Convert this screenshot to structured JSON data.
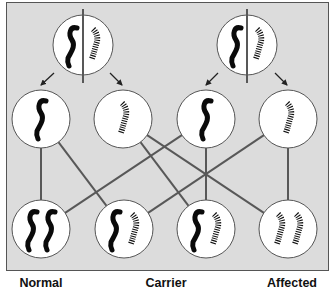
{
  "colors": {
    "panel_background": "#dcdcdc",
    "panel_border": "#555555",
    "circle_fill": "#ffffff",
    "circle_stroke": "#555555",
    "line": "#585858",
    "normal_chromosome": "#0a0a0a",
    "mutant_chromosome": "#111111"
  },
  "parents": [
    {
      "id": "parent-1",
      "cx": 83,
      "cy": 45,
      "r": 30,
      "genotype": "carrier",
      "alleles": [
        "normal",
        "mutant"
      ]
    },
    {
      "id": "parent-2",
      "cx": 247,
      "cy": 45,
      "r": 30,
      "genotype": "carrier",
      "alleles": [
        "normal",
        "mutant"
      ]
    }
  ],
  "gametes": [
    {
      "id": "gamete-1",
      "cx": 41,
      "cy": 119,
      "r": 29,
      "allele": "normal",
      "from": "parent-1"
    },
    {
      "id": "gamete-2",
      "cx": 123,
      "cy": 119,
      "r": 29,
      "allele": "mutant",
      "from": "parent-1"
    },
    {
      "id": "gamete-3",
      "cx": 206,
      "cy": 119,
      "r": 29,
      "allele": "normal",
      "from": "parent-2"
    },
    {
      "id": "gamete-4",
      "cx": 288,
      "cy": 119,
      "r": 29,
      "allele": "mutant",
      "from": "parent-2"
    }
  ],
  "offspring": [
    {
      "id": "offspring-1",
      "cx": 41,
      "cy": 229,
      "r": 29,
      "alleles": [
        "normal",
        "normal"
      ],
      "genotype": "normal"
    },
    {
      "id": "offspring-2",
      "cx": 124,
      "cy": 229,
      "r": 29,
      "alleles": [
        "normal",
        "mutant"
      ],
      "genotype": "carrier"
    },
    {
      "id": "offspring-3",
      "cx": 206,
      "cy": 229,
      "r": 29,
      "alleles": [
        "normal",
        "mutant"
      ],
      "genotype": "carrier"
    },
    {
      "id": "offspring-4",
      "cx": 288,
      "cy": 229,
      "r": 29,
      "alleles": [
        "mutant",
        "mutant"
      ],
      "genotype": "affected"
    }
  ],
  "connections": [
    {
      "from": "gamete-1",
      "to": "offspring-1"
    },
    {
      "from": "gamete-1",
      "to": "offspring-2"
    },
    {
      "from": "gamete-2",
      "to": "offspring-3"
    },
    {
      "from": "gamete-2",
      "to": "offspring-4"
    },
    {
      "from": "gamete-3",
      "to": "offspring-1"
    },
    {
      "from": "gamete-3",
      "to": "offspring-3"
    },
    {
      "from": "gamete-4",
      "to": "offspring-2"
    },
    {
      "from": "gamete-4",
      "to": "offspring-4"
    }
  ],
  "arrows": [
    {
      "x1": 54,
      "y1": 73,
      "x2": 41,
      "y2": 85
    },
    {
      "x1": 110,
      "y1": 73,
      "x2": 122,
      "y2": 85
    },
    {
      "x1": 218,
      "y1": 73,
      "x2": 206,
      "y2": 85
    },
    {
      "x1": 275,
      "y1": 73,
      "x2": 287,
      "y2": 85
    }
  ],
  "labels": [
    {
      "text": "Normal",
      "x": 41
    },
    {
      "text": "Carrier",
      "x": 166
    },
    {
      "text": "Affected",
      "x": 292
    }
  ]
}
